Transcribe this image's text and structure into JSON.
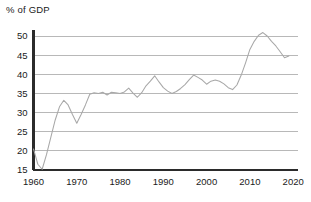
{
  "chart_data": {
    "type": "line",
    "title": "",
    "xlabel": "",
    "ylabel": "% of GDP",
    "ylabel_position": "top-left",
    "xlim": [
      1960,
      2021
    ],
    "ylim": [
      15,
      52
    ],
    "grid": true,
    "grid_axis": "y",
    "legend": "none",
    "yticks": [
      15,
      20,
      25,
      30,
      35,
      40,
      45,
      50
    ],
    "ytick_labels": [
      "15",
      "20",
      "25",
      "30",
      "35",
      "40",
      "45",
      "50"
    ],
    "xticks": [
      1960,
      1970,
      1980,
      1990,
      2000,
      2010,
      2020
    ],
    "xtick_labels": [
      "1960",
      "1970",
      "1980",
      "1990",
      "2000",
      "2010",
      "2020"
    ],
    "line_color": "#a8a8a8",
    "axis_color": "#2b2b2b",
    "gridline_color": "#9a9a9a",
    "series": [
      {
        "name": "% of GDP",
        "x": [
          1960,
          1961,
          1962,
          1963,
          1964,
          1965,
          1966,
          1967,
          1968,
          1969,
          1970,
          1971,
          1972,
          1973,
          1974,
          1975,
          1976,
          1977,
          1978,
          1979,
          1980,
          1981,
          1982,
          1983,
          1984,
          1985,
          1986,
          1987,
          1988,
          1989,
          1990,
          1991,
          1992,
          1993,
          1994,
          1995,
          1996,
          1997,
          1998,
          1999,
          2000,
          2001,
          2002,
          2003,
          2004,
          2005,
          2006,
          2007,
          2008,
          2009,
          2010,
          2011,
          2012,
          2013,
          2014,
          2015,
          2016,
          2017,
          2018,
          2019
        ],
        "values": [
          20.5,
          16.5,
          15.2,
          19.0,
          23.5,
          28.0,
          31.5,
          33.2,
          32.0,
          29.5,
          27.2,
          29.5,
          32.0,
          34.8,
          35.2,
          35.0,
          35.3,
          34.6,
          35.3,
          35.2,
          35.0,
          35.4,
          36.4,
          35.1,
          34.0,
          35.2,
          37.0,
          38.2,
          39.6,
          38.0,
          36.5,
          35.6,
          35.0,
          35.5,
          36.3,
          37.3,
          38.6,
          39.8,
          39.2,
          38.5,
          37.4,
          38.2,
          38.5,
          38.2,
          37.5,
          36.5,
          36.0,
          37.2,
          39.8,
          43.0,
          46.5,
          48.6,
          50.2,
          50.9,
          50.0,
          48.6,
          47.4,
          45.9,
          44.3,
          44.8
        ]
      }
    ]
  }
}
